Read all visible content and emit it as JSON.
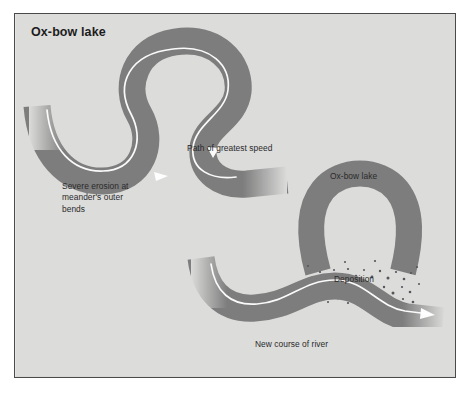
{
  "figure": {
    "title": "Ox-bow lake",
    "background_color": "#dcdcdb",
    "border_color": "#4a4a4a",
    "river_color": "#7d7d7d",
    "flowline_color": "#ffffff",
    "text_color": "#2a2a2a"
  },
  "labels": {
    "erosion": "Severe erosion at\nmeander's outer\nbends",
    "greatest_speed": "Path of greatest speed",
    "oxbow_lake": "Ox-bow lake",
    "deposition": "Deposition",
    "new_course": "New course of river"
  },
  "diagram_parts": {
    "upper_river_name": "meandering-river-channel",
    "oxbow_lake_name": "oxbow-lake-horseshoe",
    "new_course_name": "new-river-course",
    "deposition_patch_name": "deposition-sediment-patch",
    "flow_arrow_count": 3
  }
}
